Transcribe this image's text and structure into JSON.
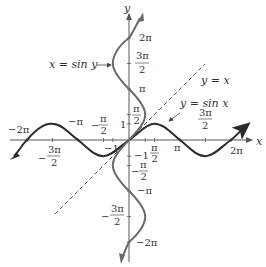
{
  "figure": {
    "origin_px": [
      129,
      140
    ],
    "pi_px": 51,
    "colors": {
      "sin_x_curve": "#2b2b2b",
      "sin_y_curve": "#6a6a6a",
      "identity_line": "#555555",
      "axis": "#555555",
      "text": "#333333"
    },
    "axes": {
      "x_label": "x",
      "y_label": "y"
    },
    "x_ticks": [
      {
        "label": "−2π",
        "value": "-2pi"
      },
      {
        "label": "−π",
        "value": "-pi"
      },
      {
        "label_num": "π",
        "label_den": "2",
        "sign": "−",
        "value": "-pi/2"
      },
      {
        "label_num": "3π",
        "label_den": "2",
        "sign": "−",
        "value": "-3pi/2"
      },
      {
        "label": "−1",
        "value": "-1"
      },
      {
        "label_num": "π",
        "label_den": "2",
        "value": "pi/2"
      },
      {
        "label": "π",
        "value": "pi"
      },
      {
        "label_num": "3π",
        "label_den": "2",
        "value": "3pi/2"
      },
      {
        "label": "2π",
        "value": "2pi"
      }
    ],
    "y_ticks": [
      {
        "label": "2π",
        "value": "2pi"
      },
      {
        "label_num": "3π",
        "label_den": "2",
        "value": "3pi/2"
      },
      {
        "label": "π",
        "value": "pi"
      },
      {
        "label_num": "π",
        "label_den": "2",
        "value": "pi/2"
      },
      {
        "label": "1",
        "value": "1"
      },
      {
        "label": "−1",
        "value": "-1"
      },
      {
        "label_num": "π",
        "label_den": "2",
        "sign": "−",
        "value": "-pi/2"
      },
      {
        "label": "−π",
        "value": "-pi"
      },
      {
        "label_num": "3π",
        "label_den": "2",
        "sign": "−",
        "value": "-3pi/2"
      },
      {
        "label": "−2π",
        "value": "-2pi"
      }
    ],
    "annotations": {
      "sin_y": "x = sin y",
      "identity": "y = x",
      "sin_x": "y = sin x"
    }
  }
}
